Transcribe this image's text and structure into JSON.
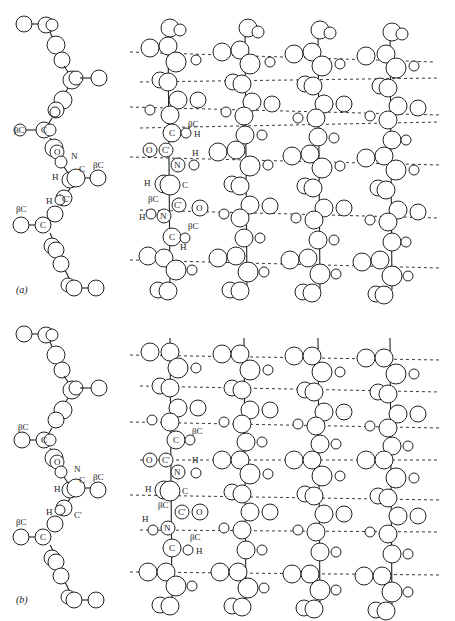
{
  "figure": {
    "panels": [
      {
        "id": "a",
        "label": "(a)",
        "side_view_labels": [
          "βC",
          "C",
          "O",
          "N",
          "C",
          "βC",
          "H",
          "C'",
          "H",
          "βC",
          "C"
        ],
        "sheet_labels": [
          "βC",
          "C",
          "H",
          "O",
          "C'",
          "N",
          "H",
          "H",
          "C",
          "βC",
          "C'",
          "O",
          "H",
          "N",
          "C",
          "βC",
          "H"
        ],
        "strands": 4
      },
      {
        "id": "b",
        "label": "(b)",
        "side_view_labels": [
          "βC",
          "C",
          "O",
          "N",
          "C",
          "βC",
          "H",
          "C'",
          "βC",
          "C"
        ],
        "sheet_labels": [
          "C",
          "βC",
          "O",
          "C'",
          "N",
          "H",
          "H",
          "C",
          "βC",
          "C'",
          "O",
          "H",
          "N",
          "C",
          "βC",
          "H"
        ],
        "strands": 4
      }
    ],
    "colors": {
      "background": "#ffffff",
      "line": "#222222"
    }
  },
  "labels": {
    "a": "(a)",
    "b": "(b)",
    "betaC": "βC",
    "C": "C",
    "Cp": "C'",
    "N": "N",
    "O": "O",
    "H": "H"
  }
}
